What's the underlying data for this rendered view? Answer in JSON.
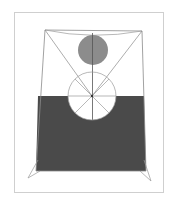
{
  "artwork": {
    "description": "Abstract geometric composition: trapezoid frame with diagonals, gray disc at top, dark gray block with white semicircular cutout and spoked circle at center",
    "colors": {
      "background": "#ffffff",
      "frame": "#d0d0d0",
      "line": "#8a8a8a",
      "disc": "#8c8c8c",
      "block": "#4a4a4a"
    }
  }
}
